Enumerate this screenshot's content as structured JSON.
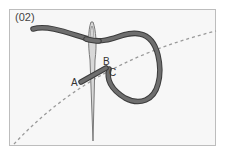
{
  "diagram": {
    "step_label": "(02)",
    "points": [
      {
        "id": "A",
        "label": "A"
      },
      {
        "id": "B",
        "label": "B"
      },
      {
        "id": "C",
        "label": "C"
      }
    ],
    "colors": {
      "background": "#f7f7f7",
      "border": "#bdbdbd",
      "thread": "#6b6b6b",
      "thread_outline": "#3c3c3c",
      "needle": "#9a9a9a",
      "stitch_line": "#9a9a9a"
    }
  }
}
